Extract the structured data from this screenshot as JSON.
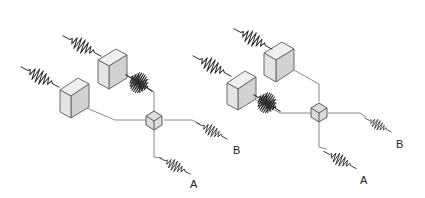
{
  "diagrams": [
    {
      "id": "left",
      "description": "Two wave packets enter through two slabs (delay elements); they recombine at a beam-splitter cube and exit toward outputs A and B. Upper packet overlaps on the crossing beam (interference burst).",
      "labels": {
        "output_a": "A",
        "output_b": "B"
      }
    },
    {
      "id": "right",
      "description": "Same arrangement with swapped slab positions; interference burst on the lower-left beam; outputs A and B.",
      "labels": {
        "output_a": "A",
        "output_b": "B"
      }
    }
  ],
  "colors": {
    "beam": "#8a8a8a",
    "wave": "#2a2a2a",
    "slab_face": "#e4e4e4",
    "cube_face": "#dcdcdc",
    "background": "#ffffff"
  }
}
